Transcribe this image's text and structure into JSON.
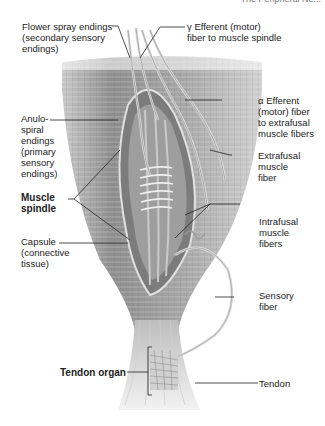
{
  "header": {
    "text": "The Peripheral Ne..."
  },
  "labels": {
    "flower_spray": [
      "Flower spray endings",
      "(secondary sensory",
      "endings)"
    ],
    "gamma_efferent": [
      "γ Efferent (motor)",
      "fiber to muscle spindle"
    ],
    "anulospiral": [
      "Anulo-",
      "spiral",
      "endings",
      "(primary",
      "sensory",
      "endings)"
    ],
    "alpha_efferent": [
      "α Efferent",
      "(motor) fiber",
      "to extrafusal",
      "muscle fibers"
    ],
    "extrafusal": [
      "Extrafusal",
      "muscle",
      "fiber"
    ],
    "muscle_spindle": [
      "Muscle",
      "spindle"
    ],
    "intrafusal": [
      "Intrafusal",
      "muscle",
      "fibers"
    ],
    "capsule": [
      "Capsule",
      "(connective",
      "tissue)"
    ],
    "sensory_fiber": [
      "Sensory",
      "fiber"
    ],
    "tendon_organ": [
      "Tendon organ"
    ],
    "tendon": [
      "Tendon"
    ]
  },
  "colors": {
    "muscle": "#9a9a9a",
    "muscle_light": "#d8d8d8",
    "tendon": "#e6e6e6",
    "leader": "#222222",
    "background": "#ffffff"
  }
}
